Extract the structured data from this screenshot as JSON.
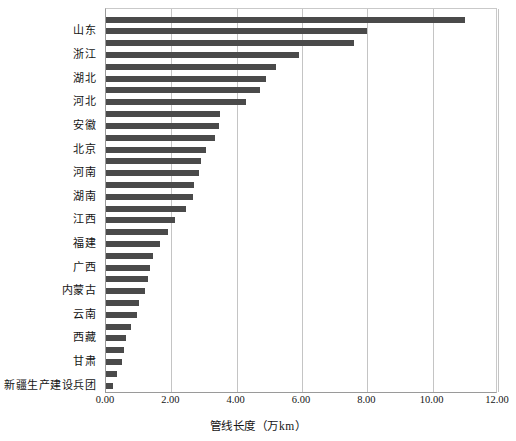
{
  "chart_data": {
    "type": "bar",
    "orientation": "horizontal",
    "title": "",
    "xlabel": "管线长度（万km）",
    "ylabel": "",
    "xlim": [
      0,
      12
    ],
    "xticks": [
      "0.00",
      "2.00",
      "4.00",
      "6.00",
      "8.00",
      "10.00",
      "12.00"
    ],
    "xtick_values": [
      0,
      2,
      4,
      6,
      8,
      10,
      12
    ],
    "grid": "vertical",
    "legend": "none",
    "bar_color": "#4a4a4a",
    "labeled_every_n": 2,
    "categories": [
      "",
      "山东",
      "",
      "浙江",
      "",
      "湖北",
      "",
      "河北",
      "",
      "安徽",
      "",
      "北京",
      "",
      "河南",
      "",
      "湖南",
      "",
      "江西",
      "",
      "福建",
      "",
      "广西",
      "",
      "内蒙古",
      "",
      "云南",
      "",
      "西藏",
      "",
      "甘肃",
      "",
      "新疆生产建设兵团"
    ],
    "visible_tick_labels": [
      "山东",
      "浙江",
      "湖北",
      "河北",
      "安徽",
      "北京",
      "河南",
      "湖南",
      "江西",
      "福建",
      "广西",
      "内蒙古",
      "云南",
      "西藏",
      "甘肃",
      "新疆生产建设兵团"
    ],
    "values": [
      11.0,
      8.0,
      7.6,
      5.9,
      5.2,
      4.9,
      4.7,
      4.3,
      3.5,
      3.45,
      3.35,
      3.05,
      2.9,
      2.85,
      2.7,
      2.65,
      2.45,
      2.1,
      1.9,
      1.65,
      1.45,
      1.35,
      1.3,
      1.2,
      1.0,
      0.95,
      0.75,
      0.6,
      0.55,
      0.48,
      0.35,
      0.22
    ]
  }
}
